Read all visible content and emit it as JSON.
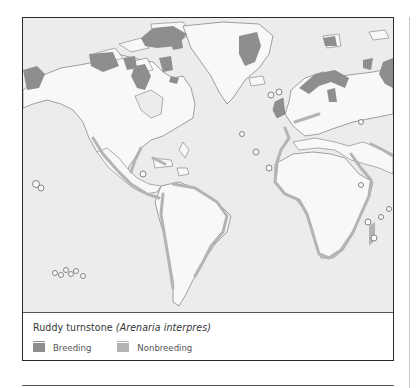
{
  "figure": {
    "caption_common": "Ruddy turnstone ",
    "caption_scientific": "(Arenaria interpres)"
  },
  "legend": [
    {
      "label": "Breeding",
      "color": "#8e8e8e"
    },
    {
      "label": "Nonbreeding",
      "color": "#b4b4b4"
    }
  ],
  "map": {
    "ocean_color": "#ececec",
    "land_color": "#f8f8f8",
    "outline_color": "#7a7a7a"
  }
}
